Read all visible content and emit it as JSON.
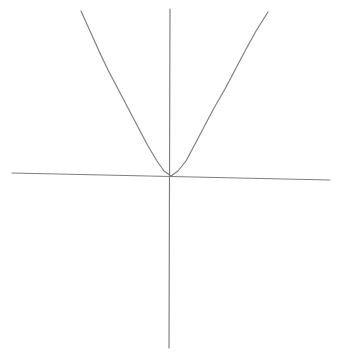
{
  "figure": {
    "kind": "graph-sketch",
    "background_color": "#ffffff",
    "width": 338,
    "height": 354,
    "stroke_color": "#7e7e80",
    "curve_color": "#808083"
  },
  "chart_data": {
    "type": "line",
    "title": "",
    "subtitle": "",
    "xlabel": "",
    "ylabel": "",
    "grid": false,
    "legend": null,
    "annotations": [],
    "tick_labels": {
      "x": [],
      "y": []
    },
    "axes": {
      "x_axis": {
        "name": "x-axis",
        "start": [
          12,
          173
        ],
        "end": [
          330,
          180
        ],
        "hand_drawn_tilt": true
      },
      "y_axis": {
        "name": "y-axis",
        "start": [
          170,
          9
        ],
        "end": [
          169,
          348
        ],
        "hand_drawn_tilt": true
      },
      "origin": [
        171,
        176
      ]
    },
    "series": [
      {
        "name": "parabola",
        "shape": "parabola-opening-upward",
        "vertex": [
          171,
          176
        ],
        "points": [
          [
            81,
            11
          ],
          [
            90,
            31
          ],
          [
            99,
            51
          ],
          [
            108,
            70
          ],
          [
            118,
            89
          ],
          [
            128,
            108
          ],
          [
            138,
            127
          ],
          [
            148,
            146
          ],
          [
            157,
            161
          ],
          [
            164,
            171
          ],
          [
            171,
            176
          ],
          [
            178,
            171
          ],
          [
            186,
            161
          ],
          [
            194,
            146
          ],
          [
            204,
            127
          ],
          [
            214,
            108
          ],
          [
            225,
            89
          ],
          [
            235,
            70
          ],
          [
            245,
            51
          ],
          [
            256,
            31
          ],
          [
            268,
            12
          ]
        ]
      }
    ]
  }
}
